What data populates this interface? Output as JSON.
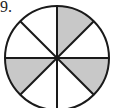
{
  "problem": {
    "number": "9."
  },
  "diagram": {
    "shape": "circle",
    "sectors": 8,
    "shaded_sectors": 3,
    "shaded_positions": [
      "top-right",
      "right-lower",
      "left-lower"
    ],
    "colors": {
      "stroke": "#1a1a1a",
      "shade": "#c8c8c8",
      "background": "#ffffff"
    }
  }
}
